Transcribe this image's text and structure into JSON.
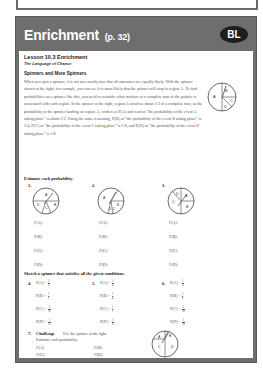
{
  "card": {
    "title": "Enrichment",
    "page_ref": "(p. 32)",
    "badge": "BL",
    "header_color": "#6e6e6e",
    "badge_color": "#1e1e1e"
  },
  "lesson": {
    "title": "Lesson 10.3 Enrichment",
    "subtitle": "The Language of Chance",
    "section": "Spinners and More Spinners",
    "paragraph": "When you spin a spinner, it is not necessarily true that all outcomes are equally likely. With the spinner shown at the right, for example, you can see it is most likely that the pointer will stop in region A. To find probabilities on a spinner like this, you need to consider what fraction of a complete turn of the pointer is associated with each region. In the spinner at the right, region A involves about 1/2 of a complete turn, so the probability of the spinner landing on region A, written as P(A) and read as \"the probability of the event A taking place\" is about 1/2. Using the same reasoning, P(B) or \"the probability of the event B taking place\" is 1/4, P(C) or \"the probability of the event C taking place\" is 1/8, and P(D) or \"the probability of the event D taking place\" is 1/8."
  },
  "estimate": {
    "heading": "Estimate each probability.",
    "problems": [
      {
        "num": "1.",
        "labels": [
          "P(A):",
          "P(B):",
          "P(C):",
          "P(D):"
        ]
      },
      {
        "num": "2.",
        "labels": [
          "P(A):",
          "P(B):",
          "P(C):",
          "P(D):"
        ]
      },
      {
        "num": "3.",
        "labels": [
          "P(A):",
          "P(B):",
          "P(C):",
          "P(D):"
        ]
      }
    ]
  },
  "sketch": {
    "heading": "Sketch a spinner that satisfies all the given conditions.",
    "problems": [
      {
        "num": "4.",
        "conditions": [
          {
            "label": "P(A) =",
            "n": "1",
            "d": "2"
          },
          {
            "label": "P(B) =",
            "n": "1",
            "d": "3"
          },
          {
            "label": "P(C) =",
            "n": "1",
            "d": "12"
          },
          {
            "label": "P(D) =",
            "n": "1",
            "d": "12"
          }
        ]
      },
      {
        "num": "5.",
        "conditions": [
          {
            "label": "P(A) =",
            "n": "1",
            "d": "4"
          },
          {
            "label": "P(B) =",
            "n": "1",
            "d": "4"
          },
          {
            "label": "P(C) =",
            "n": "1",
            "d": "3"
          },
          {
            "label": "P(D) =",
            "n": "1",
            "d": "6"
          }
        ]
      },
      {
        "num": "6.",
        "conditions": [
          {
            "label": "P(A) =",
            "n": "1",
            "d": "8"
          },
          {
            "label": "P(B) =",
            "n": "5",
            "d": "8"
          },
          {
            "label": "P(C) =",
            "n": "3",
            "d": "16"
          },
          {
            "label": "P(D) =",
            "n": "1",
            "d": "16"
          }
        ]
      }
    ]
  },
  "challenge": {
    "num": "7.",
    "label": "Challenge",
    "text1": "Use the spinner at the right.",
    "text2": "Estimate each probability.",
    "labels": [
      "P(A):",
      "P(B):",
      "P(C):",
      "P(D):"
    ]
  },
  "spinner_labels": {
    "intro": [
      "A",
      "B",
      "C",
      "D"
    ],
    "p1": [
      "A",
      "B",
      "C",
      "D"
    ],
    "p2": [
      "A",
      "B",
      "C",
      "D"
    ],
    "p3": [
      "A",
      "B",
      "C",
      "D"
    ],
    "p7": [
      "A",
      "B",
      "C",
      "D"
    ]
  }
}
